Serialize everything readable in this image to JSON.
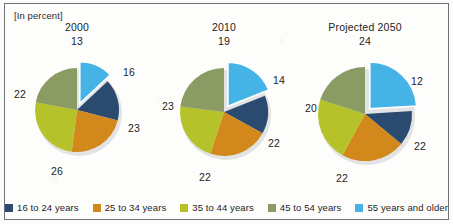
{
  "unit_note": "[In percent]",
  "colors": {
    "age_16_24": "#2b4a6f",
    "age_25_34": "#d3881c",
    "age_35_44": "#b5c229",
    "age_45_54": "#8a9b63",
    "age_55_plus": "#46b3e6",
    "frame": "#6f7175",
    "text": "#1d1d1d",
    "background": "#fdfdfc"
  },
  "legend": {
    "items": [
      {
        "label": "16 to 24 years",
        "color": "#2b4a6f"
      },
      {
        "label": "25 to 34 years",
        "color": "#d3881c"
      },
      {
        "label": "35 to 44 years",
        "color": "#b5c229"
      },
      {
        "label": "45 to 54 years",
        "color": "#8a9b63"
      },
      {
        "label": "55 years and older",
        "color": "#46b3e6"
      }
    ]
  },
  "chart_data": {
    "type": "pie",
    "title": "",
    "subtitle": "[In percent]",
    "xlabel": "",
    "ylabel": "",
    "value_unit": "percent",
    "legend_position": "bottom",
    "grid": false,
    "exploded_slice": "55 years and older",
    "categories": [
      "16 to 24 years",
      "25 to 34 years",
      "35 to 44 years",
      "45 to 54 years",
      "55 years and older"
    ],
    "category_colors": [
      "#2b4a6f",
      "#d3881c",
      "#b5c229",
      "#8a9b63",
      "#46b3e6"
    ],
    "series": [
      {
        "name": "2000",
        "values": [
          16,
          23,
          26,
          22,
          13
        ]
      },
      {
        "name": "2010",
        "values": [
          14,
          22,
          22,
          23,
          19
        ]
      },
      {
        "name": "Projected 2050",
        "values": [
          12,
          22,
          22,
          20,
          24
        ]
      }
    ]
  },
  "pies": [
    {
      "title": "2000",
      "cx": 77,
      "cy": 110,
      "r": 42,
      "title_x": 77,
      "title_y": 21,
      "slices": [
        {
          "category": "55 years and older",
          "value": 13,
          "label": "13",
          "color": "#46b3e6",
          "exploded": true,
          "lx": 77,
          "ly": 35
        },
        {
          "category": "16 to 24 years",
          "value": 16,
          "label": "16",
          "color": "#2b4a6f",
          "exploded": false,
          "lx": 129,
          "ly": 66
        },
        {
          "category": "25 to 34 years",
          "value": 23,
          "label": "23",
          "color": "#d3881c",
          "exploded": false,
          "lx": 134,
          "ly": 122
        },
        {
          "category": "35 to 44 years",
          "value": 26,
          "label": "26",
          "color": "#b5c229",
          "exploded": false,
          "lx": 57,
          "ly": 165
        },
        {
          "category": "45 to 54 years",
          "value": 22,
          "label": "22",
          "color": "#8a9b63",
          "exploded": false,
          "lx": 20,
          "ly": 88
        }
      ]
    },
    {
      "title": "2010",
      "cx": 224,
      "cy": 112,
      "r": 44,
      "title_x": 224,
      "title_y": 21,
      "slices": [
        {
          "category": "55 years and older",
          "value": 19,
          "label": "19",
          "color": "#46b3e6",
          "exploded": true,
          "lx": 224,
          "ly": 35
        },
        {
          "category": "16 to 24 years",
          "value": 14,
          "label": "14",
          "color": "#2b4a6f",
          "exploded": false,
          "lx": 279,
          "ly": 74
        },
        {
          "category": "25 to 34 years",
          "value": 22,
          "label": "22",
          "color": "#d3881c",
          "exploded": false,
          "lx": 274,
          "ly": 137
        },
        {
          "category": "35 to 44 years",
          "value": 22,
          "label": "22",
          "color": "#b5c229",
          "exploded": false,
          "lx": 205,
          "ly": 171
        },
        {
          "category": "45 to 54 years",
          "value": 23,
          "label": "23",
          "color": "#8a9b63",
          "exploded": false,
          "lx": 168,
          "ly": 100
        }
      ]
    },
    {
      "title": "Projected 2050",
      "cx": 365,
      "cy": 114,
      "r": 47,
      "title_x": 365,
      "title_y": 21,
      "slices": [
        {
          "category": "55 years and older",
          "value": 24,
          "label": "24",
          "color": "#46b3e6",
          "exploded": true,
          "lx": 365,
          "ly": 35
        },
        {
          "category": "16 to 24 years",
          "value": 12,
          "label": "12",
          "color": "#2b4a6f",
          "exploded": false,
          "lx": 417,
          "ly": 75
        },
        {
          "category": "25 to 34 years",
          "value": 22,
          "label": "22",
          "color": "#d3881c",
          "exploded": false,
          "lx": 420,
          "ly": 140
        },
        {
          "category": "35 to 44 years",
          "value": 22,
          "label": "22",
          "color": "#b5c229",
          "exploded": false,
          "lx": 342,
          "ly": 172
        },
        {
          "category": "45 to 54 years",
          "value": 20,
          "label": "20",
          "color": "#8a9b63",
          "exploded": false,
          "lx": 311,
          "ly": 102
        }
      ]
    }
  ]
}
